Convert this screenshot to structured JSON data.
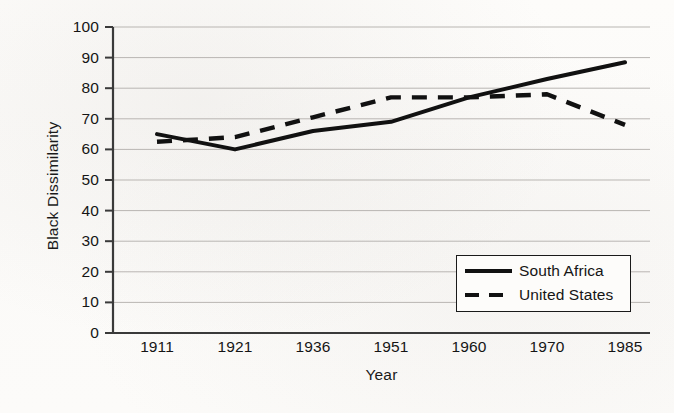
{
  "chart_data": {
    "type": "line",
    "title": "",
    "xlabel": "Year",
    "ylabel": "Black Dissimilarity",
    "categories": [
      "1911",
      "1921",
      "1936",
      "1951",
      "1960",
      "1970",
      "1985"
    ],
    "ylim": [
      0,
      100
    ],
    "ytick_step": 10,
    "yticks": [
      "100",
      "90",
      "80",
      "70",
      "60",
      "50",
      "40",
      "30",
      "20",
      "10",
      "0"
    ],
    "grid": true,
    "legend_position": "inside-lower-right",
    "series": [
      {
        "name": "South Africa",
        "style": "solid",
        "color": "#111111",
        "values": [
          65,
          60,
          66,
          69,
          77,
          83,
          88.5
        ]
      },
      {
        "name": "United States",
        "style": "dashed",
        "color": "#111111",
        "values": [
          62.5,
          64,
          70.5,
          77,
          77,
          78,
          68
        ]
      }
    ]
  },
  "legend": {
    "items": [
      {
        "label": "South Africa",
        "style": "solid"
      },
      {
        "label": "United States",
        "style": "dashed"
      }
    ]
  }
}
